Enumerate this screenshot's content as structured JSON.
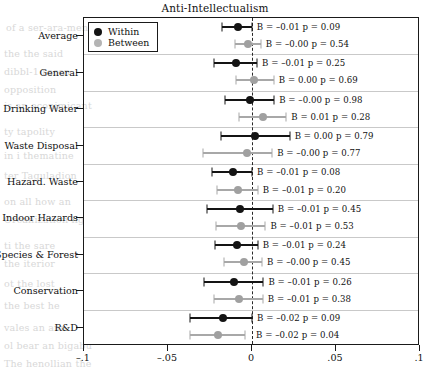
{
  "figure": {
    "title": "Anti-Intellectualism",
    "legend": [
      {
        "label": "Within",
        "color": "#141414"
      },
      {
        "label": "Between",
        "color": "#b4b4b4"
      }
    ]
  },
  "ghost_text": [
    {
      "text": "of a ser-ara-mental",
      "x": 6,
      "y": 22
    },
    {
      "text": "the the said",
      "x": 4,
      "y": 48
    },
    {
      "text": "dibbl-1 recen",
      "x": 4,
      "y": 66
    },
    {
      "text": "opposition",
      "x": 4,
      "y": 84
    },
    {
      "text": "is an econimicant",
      "x": 4,
      "y": 100
    },
    {
      "text": "ty tapolity",
      "x": 4,
      "y": 126
    },
    {
      "text": "in i thematine",
      "x": 4,
      "y": 150
    },
    {
      "text": "ter Taguladion",
      "x": 4,
      "y": 170
    },
    {
      "text": "on all how an",
      "x": 4,
      "y": 196
    },
    {
      "text": "Orcanization lig",
      "x": 4,
      "y": 214
    },
    {
      "text": "ti the sare",
      "x": 4,
      "y": 240
    },
    {
      "text": "the iterior",
      "x": 4,
      "y": 258
    },
    {
      "text": "ot the lost",
      "x": 4,
      "y": 278
    },
    {
      "text": "the best he",
      "x": 4,
      "y": 300
    },
    {
      "text": "vales an ann",
      "x": 4,
      "y": 322
    },
    {
      "text": "ol bear an bigabu",
      "x": 4,
      "y": 340
    },
    {
      "text": "The henollian the",
      "x": 4,
      "y": 358
    }
  ],
  "chart_data": {
    "type": "scatter",
    "title": "Anti-Intellectualism",
    "xlabel": "",
    "ylabel": "",
    "xlim": [
      -0.1,
      0.1
    ],
    "xticks": [
      -0.1,
      -0.05,
      0,
      0.05,
      0.1
    ],
    "xticklabels": [
      "–.1",
      "–.05",
      "0",
      ".05",
      ".1"
    ],
    "grid": "horizontal row separators",
    "zero_reference_line": 0,
    "legend_position": "top-left inside plot",
    "series_names": [
      "Within",
      "Between"
    ],
    "categories": [
      "Average",
      "General",
      "Drinking Water",
      "Waste Disposal",
      "Hazard. Waste",
      "Indoor Hazards",
      "Species & Forest",
      "Conservation",
      "R&D"
    ],
    "rows": [
      {
        "category": "Average",
        "within": {
          "estimate": -0.0078,
          "ci_low": -0.0172,
          "ci_high": 0.0005,
          "label": "B = –0.01   p = 0.09"
        },
        "between": {
          "estimate": -0.002,
          "ci_low": -0.0096,
          "ci_high": 0.0058,
          "label": "B = –0.00   p = 0.54"
        }
      },
      {
        "category": "General",
        "within": {
          "estimate": -0.009,
          "ci_low": -0.0222,
          "ci_high": 0.0036,
          "label": "B = –0.01   p = 0.25"
        },
        "between": {
          "estimate": 0.002,
          "ci_low": -0.009,
          "ci_high": 0.0136,
          "label": "B = 0.00   p = 0.69"
        }
      },
      {
        "category": "Drinking Water",
        "within": {
          "estimate": -0.0004,
          "ci_low": -0.0152,
          "ci_high": 0.0138,
          "label": "B = –0.00   p = 0.98"
        },
        "between": {
          "estimate": 0.007,
          "ci_low": -0.007,
          "ci_high": 0.021,
          "label": "B = 0.01   p = 0.28"
        }
      },
      {
        "category": "Waste Disposal",
        "within": {
          "estimate": 0.0026,
          "ci_low": -0.0178,
          "ci_high": 0.023,
          "label": "B = 0.00   p = 0.79"
        },
        "between": {
          "estimate": -0.0026,
          "ci_low": -0.0286,
          "ci_high": 0.0126,
          "label": "B = –0.00   p = 0.77"
        }
      },
      {
        "category": "Hazard. Waste",
        "within": {
          "estimate": -0.011,
          "ci_low": -0.023,
          "ci_high": 0.0006,
          "label": "B = –0.01   p = 0.08"
        },
        "between": {
          "estimate": -0.0078,
          "ci_low": -0.02,
          "ci_high": 0.004,
          "label": "B = –0.01   p = 0.20"
        }
      },
      {
        "category": "Indoor Hazards",
        "within": {
          "estimate": -0.0066,
          "ci_low": -0.026,
          "ci_high": 0.013,
          "label": "B = –0.01   p = 0.45"
        },
        "between": {
          "estimate": -0.0058,
          "ci_low": -0.0206,
          "ci_high": 0.0086,
          "label": "B = –0.01   p = 0.53"
        }
      },
      {
        "category": "Species & Forest",
        "within": {
          "estimate": -0.0086,
          "ci_low": -0.0216,
          "ci_high": 0.004,
          "label": "B = –0.01   p = 0.24"
        },
        "between": {
          "estimate": -0.0044,
          "ci_low": -0.0158,
          "ci_high": 0.0066,
          "label": "B = –0.00   p = 0.45"
        }
      },
      {
        "category": "Conservation",
        "within": {
          "estimate": -0.01,
          "ci_low": -0.028,
          "ci_high": 0.0074,
          "label": "B = –0.01   p = 0.26"
        },
        "between": {
          "estimate": -0.007,
          "ci_low": -0.0218,
          "ci_high": 0.007,
          "label": "B = –0.01   p = 0.38"
        }
      },
      {
        "category": "R&D",
        "within": {
          "estimate": -0.0168,
          "ci_low": -0.0366,
          "ci_high": 0.0006,
          "label": "B = –0.02   p = 0.09"
        },
        "between": {
          "estimate": -0.0196,
          "ci_low": -0.0366,
          "ci_high": -0.0034,
          "label": "B = –0.02   p = 0.04"
        }
      }
    ]
  }
}
